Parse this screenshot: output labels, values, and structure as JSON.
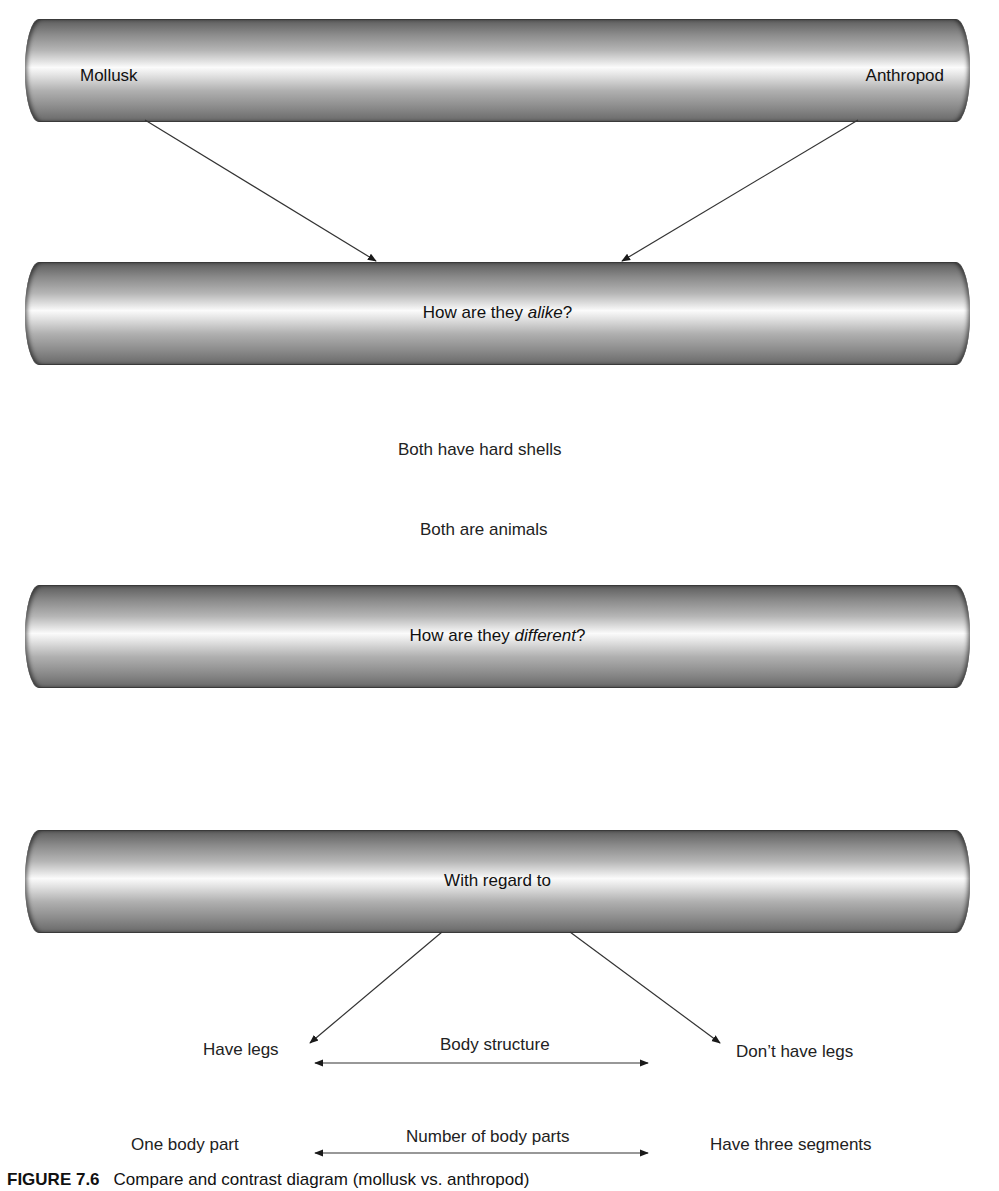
{
  "diagram": {
    "top_bar": {
      "left_label": "Mollusk",
      "right_label": "Anthropod"
    },
    "alike_bar": {
      "prefix": "How are they ",
      "emphasis": "alike",
      "suffix": "?"
    },
    "similarities": [
      "Both have hard shells",
      "Both are animals"
    ],
    "different_bar": {
      "prefix": "How are they ",
      "emphasis": "different",
      "suffix": "?"
    },
    "regard_bar": {
      "label": "With regard to"
    },
    "differences": [
      {
        "left": "Have legs",
        "attribute": "Body structure",
        "right": "Don’t have legs"
      },
      {
        "left": "One body part",
        "attribute": "Number of body parts",
        "right": "Have three segments"
      }
    ],
    "colors": {
      "bar_dark": "#5e5e5e",
      "bar_highlight": "#fbfbfb",
      "line": "#333333",
      "text": "#1a1a1a"
    }
  },
  "caption": {
    "figure_number": "FIGURE 7.6",
    "text": "Compare and contrast diagram (mollusk vs. anthropod)"
  }
}
